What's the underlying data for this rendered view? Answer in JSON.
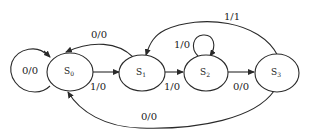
{
  "diagram": {
    "type": "state-transition-diagram",
    "states": [
      {
        "id": "s0",
        "name": "S",
        "sub": "0"
      },
      {
        "id": "s1",
        "name": "S",
        "sub": "1"
      },
      {
        "id": "s2",
        "name": "S",
        "sub": "2"
      },
      {
        "id": "s3",
        "name": "S",
        "sub": "3"
      }
    ],
    "transitions": [
      {
        "from": "s0",
        "to": "s0",
        "label": "0/0"
      },
      {
        "from": "s0",
        "to": "s1",
        "label": "1/0"
      },
      {
        "from": "s1",
        "to": "s0",
        "label": "0/0"
      },
      {
        "from": "s1",
        "to": "s2",
        "label": "1/0"
      },
      {
        "from": "s2",
        "to": "s2",
        "label": "1/0"
      },
      {
        "from": "s2",
        "to": "s3",
        "label": "0/0"
      },
      {
        "from": "s3",
        "to": "s1",
        "label": "1/1"
      },
      {
        "from": "s3",
        "to": "s0",
        "label": "0/0"
      }
    ]
  }
}
